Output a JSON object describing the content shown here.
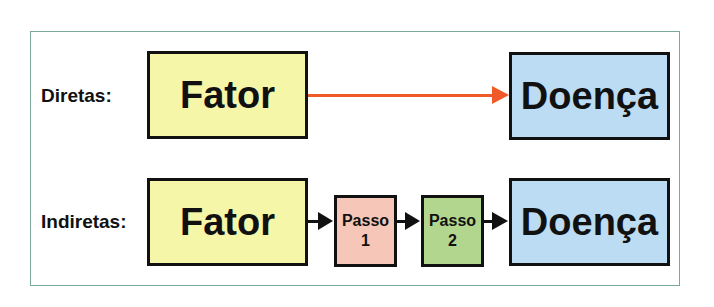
{
  "rows": [
    {
      "label": "Diretas:",
      "from": "Fator",
      "to": "Doença",
      "arrow_color": "#f05a28"
    },
    {
      "label": "Indiretas:",
      "from": "Fator",
      "steps": [
        {
          "line1": "Passo",
          "line2": "1"
        },
        {
          "line1": "Passo",
          "line2": "2"
        }
      ],
      "to": "Doença",
      "arrow_color": "#111111"
    }
  ],
  "colors": {
    "factor": "#f6f6a8",
    "disease": "#bcdcf4",
    "step1": "#f6c7b8",
    "step2": "#b2d68e",
    "frame": "#7aa89c"
  }
}
